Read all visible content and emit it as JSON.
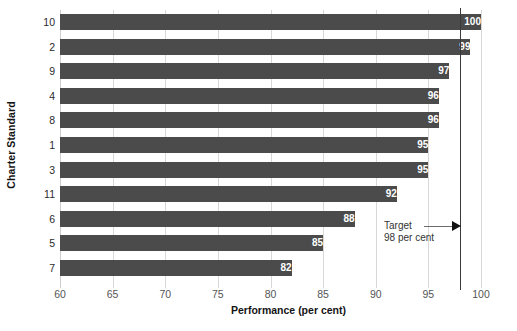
{
  "chart_data": {
    "type": "bar",
    "orientation": "horizontal",
    "title": "",
    "xlabel": "Performance (per cent)",
    "ylabel": "Charter Standard",
    "categories": [
      "10",
      "2",
      "9",
      "4",
      "8",
      "1",
      "3",
      "11",
      "6",
      "5",
      "7"
    ],
    "values": [
      100,
      99,
      97,
      96,
      96,
      95,
      95,
      92,
      88,
      85,
      82
    ],
    "value_labels": [
      "100",
      "99",
      "97",
      "96",
      "96",
      "95",
      "95",
      "92",
      "88",
      "85",
      "82"
    ],
    "xlim": [
      60,
      100
    ],
    "xticks": [
      60,
      65,
      70,
      75,
      80,
      85,
      90,
      95,
      100
    ],
    "xtick_labels": [
      "60",
      "65",
      "70",
      "75",
      "80",
      "85",
      "90",
      "95",
      "100"
    ],
    "grid": true,
    "legend": false,
    "bar_color": "#4b4b4b",
    "value_label_color": "#ffffff",
    "gridline_color": "#d8d8d8",
    "background_color": "#ffffff",
    "annotations": [
      {
        "name": "target-reference",
        "line1": "Target",
        "line2": "98 per cent",
        "value": 98,
        "line_color": "#3a3a3a",
        "arrow": "right"
      }
    ]
  }
}
